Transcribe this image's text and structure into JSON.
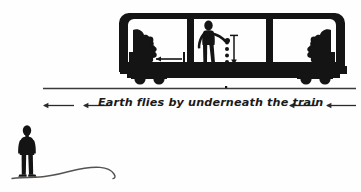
{
  "figure": {
    "title": "Earth flies by underneath the train",
    "caption": "Earth flies by underneath the train",
    "background_color": "#fefefe",
    "ink_color": "#141414"
  },
  "annotation": {
    "label": "Earth flies by underneath the train",
    "direction": "left",
    "left_arrow_outer": "arrow-left",
    "left_arrow_inner": "arrow-left",
    "right_arrow_inner": "arrow-left",
    "right_arrow_outer": "arrow-left"
  },
  "scene": {
    "train_car": {
      "name": "boxcar",
      "compartments": 3,
      "cargo_left": "cargo-silhouette",
      "cargo_right": "cargo-silhouette",
      "wheels": 4,
      "interior_arrow": "arrow-left"
    },
    "passenger": {
      "name": "person-dropping-balls",
      "dropped_balls": 4,
      "drop_arrow": "arrow-down"
    },
    "observer": {
      "name": "person-standing-on-ground",
      "ground": "wavy-terrain-line"
    },
    "rail": {
      "name": "track-line"
    }
  }
}
